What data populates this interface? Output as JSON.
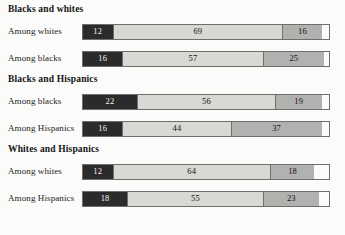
{
  "chart_data": {
    "type": "bar",
    "subtype": "stacked-horizontal-100",
    "title": "",
    "xlabel": "",
    "ylabel": "",
    "xlim": [
      0,
      100
    ],
    "grid": false,
    "legend": null,
    "value_suffix": "%",
    "series": [
      {
        "name": "Segment 1",
        "color": "#2b2b2b",
        "text_color": "#f4f4f2"
      },
      {
        "name": "Segment 2",
        "color": "#d8d8d5",
        "text_color": "#111111"
      },
      {
        "name": "Segment 3",
        "color": "#b1b1af",
        "text_color": "#111111"
      }
    ],
    "groups": [
      {
        "title": "Blacks and whites",
        "rows": [
          {
            "label": "Among whites",
            "values": [
              12,
              69,
              16
            ]
          },
          {
            "label": "Among blacks",
            "values": [
              16,
              57,
              25
            ]
          }
        ]
      },
      {
        "title": "Blacks and Hispanics",
        "rows": [
          {
            "label": "Among blacks",
            "values": [
              22,
              56,
              19
            ]
          },
          {
            "label": "Among Hispanics",
            "values": [
              16,
              44,
              37
            ]
          }
        ]
      },
      {
        "title": "Whites and Hispanics",
        "rows": [
          {
            "label": "Among whites",
            "values": [
              12,
              64,
              18
            ]
          },
          {
            "label": "Among Hispanics",
            "values": [
              18,
              55,
              23
            ]
          }
        ]
      }
    ]
  },
  "colors": {
    "background": "#fbfbfa",
    "segment_dark": "#2b2b2b",
    "segment_light": "#d8d8d5",
    "segment_mid": "#b1b1af",
    "bar_border": "#6e6e6c",
    "text": "#161616"
  }
}
